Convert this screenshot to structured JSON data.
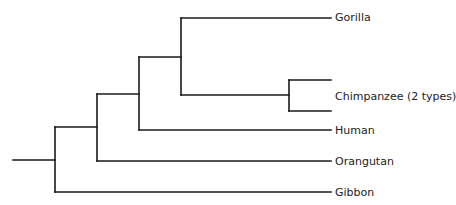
{
  "diagram": {
    "type": "phylogenetic-tree",
    "line_color": "#1a1a1a",
    "taxa": [
      {
        "id": "gorilla",
        "label": "Gorilla"
      },
      {
        "id": "chimpanzee",
        "label": "Chimpanzee (2 types)"
      },
      {
        "id": "human",
        "label": "Human"
      },
      {
        "id": "orangutan",
        "label": "Orangutan"
      },
      {
        "id": "gibbon",
        "label": "Gibbon"
      }
    ],
    "topology": "(Gibbon,(Orangutan,(Human,(Gorilla,(Chimpanzee1,Chimpanzee2)))))"
  }
}
